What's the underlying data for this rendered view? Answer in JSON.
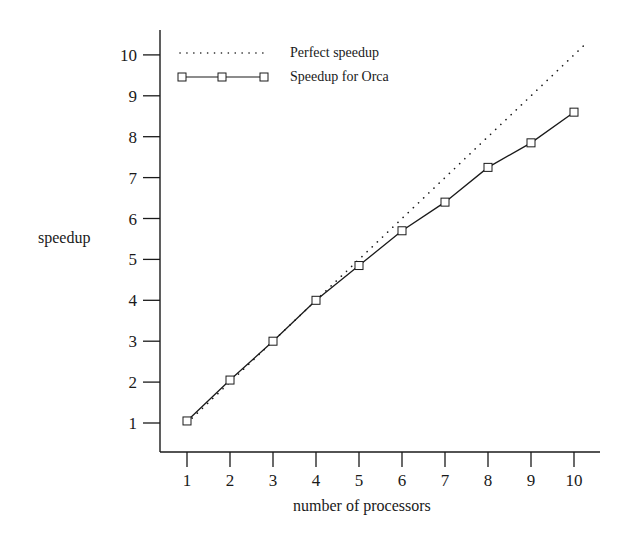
{
  "chart_data": {
    "type": "line",
    "title": "",
    "xlabel": "number of processors",
    "ylabel": "speedup",
    "x": [
      1,
      2,
      3,
      4,
      5,
      6,
      7,
      8,
      9,
      10
    ],
    "xticks": [
      "1",
      "2",
      "3",
      "4",
      "5",
      "6",
      "7",
      "8",
      "9",
      "10"
    ],
    "yticks": [
      "1",
      "2",
      "3",
      "4",
      "5",
      "6",
      "7",
      "8",
      "9",
      "10"
    ],
    "xlim": [
      0.4,
      10.5
    ],
    "ylim": [
      0.3,
      10.6
    ],
    "grid": false,
    "legend_position": "upper left",
    "series": [
      {
        "name": "Perfect speedup",
        "style": "dotted",
        "marker": "none",
        "x": [
          1,
          10.25
        ],
        "values": [
          1,
          10.25
        ]
      },
      {
        "name": "Speedup for Orca",
        "style": "solid",
        "marker": "square",
        "x": [
          1,
          2,
          3,
          4,
          5,
          6,
          7,
          8,
          9,
          10
        ],
        "values": [
          1.05,
          2.05,
          3.0,
          4.0,
          4.85,
          5.7,
          6.4,
          7.25,
          7.85,
          8.6
        ]
      }
    ]
  },
  "legend": {
    "items": [
      {
        "label": "Perfect speedup",
        "style": "dotted"
      },
      {
        "label": "Speedup for Orca",
        "style": "solid-square"
      }
    ]
  },
  "axes": {
    "x_title": "number of processors",
    "y_title": "speedup"
  },
  "colors": {
    "ink": "#1a1a1a",
    "background": "#ffffff"
  }
}
